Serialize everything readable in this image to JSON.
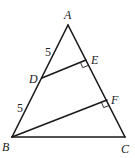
{
  "diagram": {
    "type": "geometry-triangle",
    "points": {
      "A": {
        "label": "A",
        "x": 68,
        "y": 25
      },
      "B": {
        "label": "B",
        "x": 12,
        "y": 137
      },
      "C": {
        "label": "C",
        "x": 125,
        "y": 137
      },
      "D": {
        "label": "D",
        "x": 42,
        "y": 78
      },
      "E": {
        "label": "E",
        "x": 86,
        "y": 60
      },
      "F": {
        "label": "F",
        "x": 107,
        "y": 100
      }
    },
    "segments": [
      "AB",
      "BC",
      "CA",
      "DE",
      "BF"
    ],
    "right_angles": [
      "DEA",
      "BFC"
    ],
    "measures": {
      "AD": "5",
      "DB": "5"
    }
  }
}
